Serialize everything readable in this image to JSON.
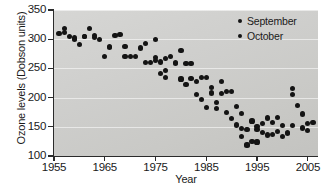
{
  "chart_data": {
    "type": "scatter",
    "title": "",
    "xlabel": "Year",
    "ylabel": "Ozone levels (Dobson units)",
    "xlim": [
      1955,
      2007
    ],
    "ylim": [
      100,
      350
    ],
    "xticks": [
      1955,
      1965,
      1975,
      1985,
      1995,
      2005
    ],
    "yticks": [
      100,
      150,
      200,
      250,
      300,
      350
    ],
    "grid": "horizontal",
    "legend_position": "top-right",
    "series": [
      {
        "name": "September",
        "marker": "circle",
        "color": "#141414",
        "points": [
          [
            1956,
            310
          ],
          [
            1957,
            318
          ],
          [
            1958,
            305
          ],
          [
            1959,
            300
          ],
          [
            1960,
            291
          ],
          [
            1961,
            305
          ],
          [
            1962,
            319
          ],
          [
            1963,
            306
          ],
          [
            1964,
            299
          ],
          [
            1965,
            270
          ],
          [
            1966,
            286
          ],
          [
            1967,
            306
          ],
          [
            1968,
            308
          ],
          [
            1969,
            288
          ],
          [
            1970,
            271
          ],
          [
            1971,
            271
          ],
          [
            1972,
            285
          ],
          [
            1973,
            292
          ],
          [
            1974,
            260
          ],
          [
            1975,
            299
          ],
          [
            1976,
            241
          ],
          [
            1977,
            267
          ],
          [
            1978,
            270
          ],
          [
            1979,
            260
          ],
          [
            1980,
            280
          ],
          [
            1981,
            258
          ],
          [
            1982,
            258
          ],
          [
            1983,
            228
          ],
          [
            1984,
            234
          ],
          [
            1985,
            235
          ],
          [
            1986,
            217
          ],
          [
            1987,
            192
          ],
          [
            1988,
            227
          ],
          [
            1989,
            211
          ],
          [
            1990,
            211
          ],
          [
            1991,
            185
          ],
          [
            1992,
            173
          ],
          [
            1993,
            145
          ],
          [
            1994,
            160
          ],
          [
            1995,
            146
          ],
          [
            1996,
            155
          ],
          [
            1997,
            165
          ],
          [
            1998,
            158
          ],
          [
            1999,
            166
          ],
          [
            2000,
            152
          ],
          [
            2001,
            139
          ],
          [
            2002,
            216
          ],
          [
            2003,
            186
          ],
          [
            2004,
            172
          ],
          [
            2005,
            156
          ],
          [
            2006,
            158
          ]
        ]
      },
      {
        "name": "October",
        "marker": "circle",
        "color": "#141414",
        "points": [
          [
            1957,
            312
          ],
          [
            1959,
            302
          ],
          [
            1961,
            304
          ],
          [
            1963,
            303
          ],
          [
            1966,
            287
          ],
          [
            1969,
            270
          ],
          [
            1973,
            260
          ],
          [
            1975,
            268
          ],
          [
            1975,
            263
          ],
          [
            1976,
            261
          ],
          [
            1977,
            246
          ],
          [
            1977,
            235
          ],
          [
            1979,
            259
          ],
          [
            1980,
            232
          ],
          [
            1981,
            222
          ],
          [
            1982,
            233
          ],
          [
            1983,
            205
          ],
          [
            1984,
            197
          ],
          [
            1985,
            183
          ],
          [
            1986,
            208
          ],
          [
            1987,
            181
          ],
          [
            1988,
            207
          ],
          [
            1989,
            175
          ],
          [
            1990,
            164
          ],
          [
            1991,
            153
          ],
          [
            1992,
            147
          ],
          [
            1992,
            133
          ],
          [
            1993,
            118
          ],
          [
            1993,
            119
          ],
          [
            1994,
            125
          ],
          [
            1995,
            124
          ],
          [
            1995,
            150
          ],
          [
            1996,
            140
          ],
          [
            1997,
            136
          ],
          [
            1998,
            137
          ],
          [
            1999,
            142
          ],
          [
            2000,
            133
          ],
          [
            2001,
            140
          ],
          [
            2002,
            205
          ],
          [
            2002,
            152
          ],
          [
            2004,
            148
          ],
          [
            2005,
            144
          ]
        ]
      }
    ]
  },
  "legend": {
    "entries": [
      {
        "label": "September"
      },
      {
        "label": "October"
      }
    ]
  }
}
